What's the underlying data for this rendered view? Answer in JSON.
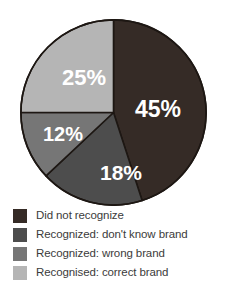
{
  "chart_data": {
    "type": "pie",
    "title": "",
    "subtitle": "",
    "xlabel": "",
    "ylabel": "",
    "legend_position": "bottom-left",
    "grid": false,
    "start_angle_deg": 0,
    "direction": "clockwise",
    "categories": [
      "Did not recognize",
      "Recognized: don't know brand",
      "Recognized: wrong brand",
      "Recognised: correct brand"
    ],
    "values": [
      45,
      18,
      12,
      25
    ],
    "value_labels": [
      "45%",
      "18%",
      "12%",
      "25%"
    ],
    "colors": [
      "#352b26",
      "#4d4d4d",
      "#767676",
      "#b5b5b5"
    ],
    "label_color": "#ffffff",
    "slices": [
      {
        "label": "Did not recognize",
        "value": 45,
        "value_label": "45%",
        "color": "#352b26",
        "start_deg": 0,
        "end_deg": 162
      },
      {
        "label": "Recognized: don't know brand",
        "value": 18,
        "value_label": "18%",
        "color": "#4d4d4d",
        "start_deg": 162,
        "end_deg": 226.8
      },
      {
        "label": "Recognized: wrong brand",
        "value": 12,
        "value_label": "12%",
        "color": "#767676",
        "start_deg": 226.8,
        "end_deg": 270
      },
      {
        "label": "Recognised: correct brand",
        "value": 25,
        "value_label": "25%",
        "color": "#b5b5b5",
        "start_deg": 270,
        "end_deg": 360
      }
    ]
  },
  "pie": {
    "labels": {
      "did_not_recognize": "45%",
      "dont_know_brand": "18%",
      "wrong_brand": "12%",
      "correct_brand": "25%"
    }
  },
  "legend": {
    "items": [
      {
        "label": "Did not recognize",
        "color": "#352b26"
      },
      {
        "label": "Recognized: don't know brand",
        "color": "#4d4d4d"
      },
      {
        "label": "Recognized: wrong brand",
        "color": "#767676"
      },
      {
        "label": "Recognised: correct brand",
        "color": "#b5b5b5"
      }
    ]
  }
}
